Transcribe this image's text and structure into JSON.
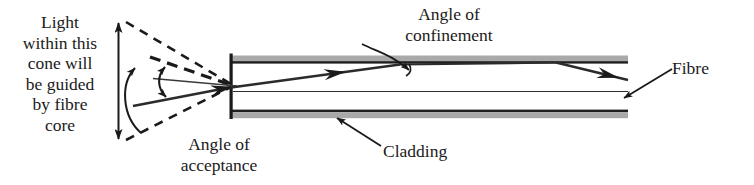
{
  "figure": {
    "background_color": "#ffffff",
    "ink_color": "#1a1a1a",
    "cladding_color": "#a8a8a8",
    "width": 754,
    "height": 185
  },
  "labels": {
    "cone_caption": "Light\nwithin this\ncone will\nbe guided\nby fibre\ncore",
    "acceptance_caption": "Angle of\nacceptance",
    "confinement_caption": "Angle of\nconfinement",
    "cladding_caption": "Cladding",
    "fibre_caption": "Fibre"
  },
  "diagram_parts": {
    "vertical_extent_arrow": "double-headed-arrow",
    "acceptance_angle_arc": "double-headed-arc-arrow",
    "confinement_angle_arc": "angle-arc",
    "cone_upper_dashed": "dashed-line",
    "cone_lower_dashed": "dashed-line",
    "dashed_incoming_ray": "dashed-ray",
    "solid_incoming_ray": "solid-ray-with-arrowhead",
    "optical_axis": "thin-horizontal-line",
    "guided_ray": "zigzag-ray-with-arrowheads",
    "fibre_end_cap": "vertical-bar",
    "top_cladding": "gray-band",
    "bottom_cladding": "gray-band",
    "core_centre_line": "thin-horizontal-line",
    "cladding_pointer": "arrow",
    "fibre_pointer": "arrow",
    "confinement_pointer": "curved-arrow"
  }
}
